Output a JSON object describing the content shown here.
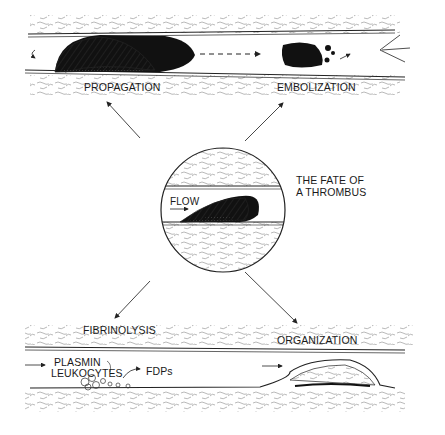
{
  "title": {
    "line1": "THE FATE OF",
    "line2": "A THROMBUS"
  },
  "center": {
    "flow_label": "FLOW"
  },
  "top_panel": {
    "left_label": "PROPAGATION",
    "right_label": "EMBOLIZATION"
  },
  "bottom_panel": {
    "left_label": "FIBRINOLYSIS",
    "right_label": "ORGANIZATION",
    "plasmin_label": "PLASMIN",
    "leukocytes_label": "LEUKOCYTES",
    "fdps_label": "FDPs"
  },
  "colors": {
    "ink": "#1a1a1a",
    "texture": "#8a8a8a",
    "background": "#ffffff"
  }
}
